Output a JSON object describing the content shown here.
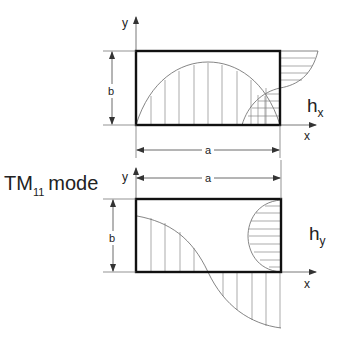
{
  "title": {
    "main": "TM",
    "subscript": "11",
    "suffix": "mode"
  },
  "top_panel": {
    "field_label": "h",
    "field_subscript": "x",
    "axis_y": "y",
    "axis_x": "x",
    "dim_width": "a",
    "dim_height": "b"
  },
  "bottom_panel": {
    "field_label": "h",
    "field_subscript": "y",
    "axis_y": "y",
    "axis_x": "x",
    "dim_width": "a",
    "dim_height": "b"
  },
  "colors": {
    "outline": "#111111",
    "thin": "#555555",
    "hatch": "#777777"
  }
}
